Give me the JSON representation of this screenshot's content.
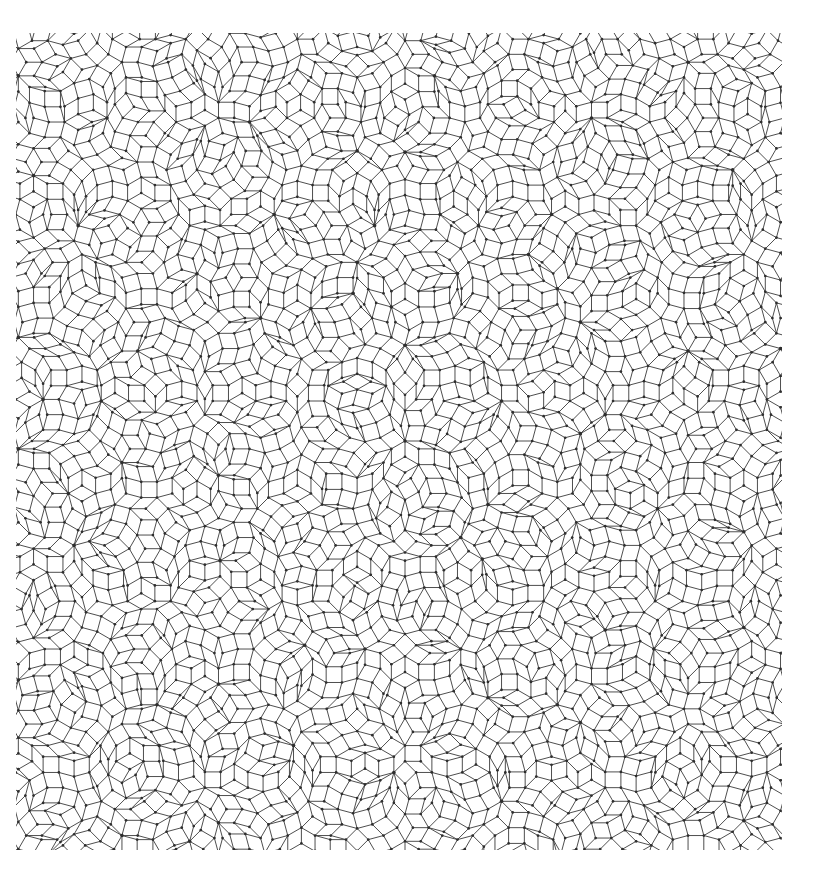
{
  "figure": {
    "kind": "geometric-tiling-diagram"
  },
  "canvas": {
    "width": 822,
    "height": 888,
    "background_color": "#ffffff"
  },
  "plot_area": {
    "left": 16,
    "top": 33,
    "right": 782,
    "bottom": 850,
    "width": 766,
    "height": 817,
    "clipped": true,
    "note": "Pattern is cropped by a rectangular window; tiles are cut at all four edges."
  },
  "style": {
    "line_color": "#3a3a3a",
    "line_width": 0.9,
    "vertex_dot_color": "#2e2e2e",
    "vertex_dot_radius": 1.35,
    "fill_color": "none",
    "antialias": true
  },
  "chart_data": {
    "type": "diagram",
    "xlabel": "",
    "ylabel": "",
    "grid": false,
    "legend": null,
    "tiling": {
      "family": "dodecagonal quasicrystal (Stampfli / square-triangle-rhomb inflation)",
      "symmetry_order": 12,
      "mirror_axis_x": 405,
      "prototiles": [
        "square",
        "equilateral-triangle",
        "thin-rhomb-30deg",
        "regular-pentagon",
        "elongated-hexagon"
      ],
      "edge_length_px": 31.5,
      "inflation_factor": 3.7320508,
      "seed": 20240517,
      "star_vertex_valence": 12,
      "generations": 3
    },
    "generator": {
      "method": "multigrid-dual",
      "grid_directions": 12,
      "grid_spacing_px": 31.5,
      "grid_offsets": [
        0.1312,
        0.2087,
        0.0459,
        0.3771,
        0.1903,
        0.264,
        0.0821,
        0.3158,
        0.1466,
        0.2933,
        0.0677,
        0.349
      ],
      "center_x": 405,
      "center_y": 441,
      "line_extent": 34
    },
    "observed_motifs": [
      {
        "name": "twelve-fold-star-vertex",
        "approx_positions": [
          [
            75,
            268
          ],
          [
            272,
            268
          ],
          [
            468,
            268
          ],
          [
            665,
            268
          ],
          [
            152,
            382
          ],
          [
            348,
            382
          ],
          [
            545,
            382
          ],
          [
            742,
            382
          ],
          [
            75,
            612
          ],
          [
            272,
            612
          ],
          [
            468,
            612
          ],
          [
            665,
            612
          ],
          [
            152,
            155
          ],
          [
            348,
            155
          ],
          [
            545,
            155
          ],
          [
            152,
            726
          ],
          [
            348,
            726
          ],
          [
            545,
            726
          ],
          [
            742,
            726
          ],
          [
            75,
            40
          ],
          [
            272,
            40
          ],
          [
            468,
            40
          ],
          [
            665,
            40
          ],
          [
            405,
            441
          ],
          [
            405,
            215
          ],
          [
            405,
            668
          ]
        ]
      },
      {
        "name": "nested-diamond-square-motif",
        "approx_positions": [
          [
            205,
            155
          ],
          [
            600,
            155
          ],
          [
            405,
            385
          ],
          [
            405,
            723
          ],
          [
            205,
            612
          ],
          [
            600,
            612
          ],
          [
            10,
            385
          ],
          [
            795,
            385
          ],
          [
            332,
            55
          ],
          [
            478,
            55
          ]
        ]
      },
      {
        "name": "pentagon-ring",
        "count_approx": 120
      },
      {
        "name": "hexagon-rosette",
        "count_approx": 40
      }
    ],
    "counts": {
      "approx_vertices": 1450,
      "approx_edges": 2900,
      "approx_faces": 1450
    }
  }
}
